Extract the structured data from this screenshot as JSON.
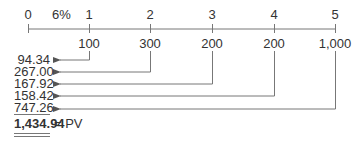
{
  "timeline": {
    "rate_label": "6%",
    "periods": [
      "0",
      "1",
      "2",
      "3",
      "4",
      "5"
    ],
    "cash_flows": [
      "100",
      "300",
      "200",
      "200",
      "1,000"
    ]
  },
  "present_values": [
    "94.34",
    "267.00",
    "167.92",
    "158.42",
    "747.26"
  ],
  "total": {
    "value": "1,434.94",
    "label": "= PV"
  },
  "colors": {
    "line": "#777777",
    "text": "#333333"
  }
}
